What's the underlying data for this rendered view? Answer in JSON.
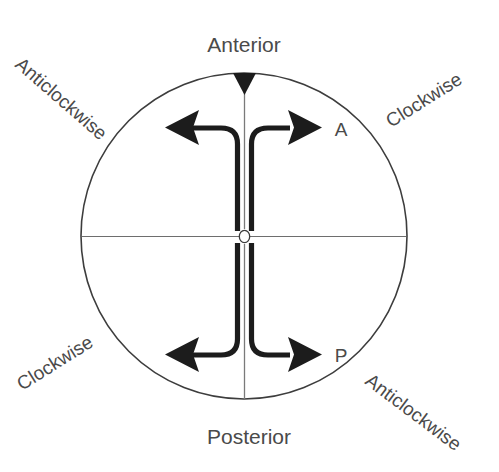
{
  "figure": {
    "background_color": "#ffffff",
    "line_color": "#1c1c1c",
    "outline_color": "#3d3d3d",
    "text_color": "#4a4a4a"
  },
  "labels": {
    "anterior": "Anterior",
    "posterior": "Posterior",
    "top_left_rotation": "Anticlockwise",
    "top_right_rotation": "Clockwise",
    "bottom_left_rotation": "Clockwise",
    "bottom_right_rotation": "Anticlockwise",
    "marker_anterior": "A",
    "marker_posterior": "P",
    "origin": "o"
  },
  "geometry": {
    "circle_center_x": 244,
    "circle_center_y": 236,
    "circle_radius": 163,
    "top_left_rotation_angle": -41,
    "top_right_rotation_angle": -32,
    "bottom_left_rotation_angle": 32,
    "bottom_right_rotation_angle": 37
  }
}
